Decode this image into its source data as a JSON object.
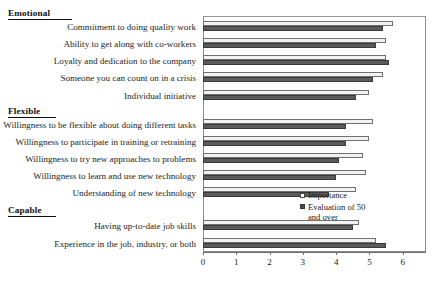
{
  "chart_data": {
    "type": "bar",
    "orientation": "horizontal",
    "title": "",
    "subtitle": "",
    "xlabel": "",
    "ylabel": "",
    "xlim": [
      0,
      6.7
    ],
    "xticks": [
      0,
      1,
      2,
      3,
      4,
      5,
      6
    ],
    "xtick_labels": [
      "0",
      "1",
      "2",
      "3",
      "4",
      "5",
      "6"
    ],
    "grid": false,
    "legend_position": "inside-right",
    "series": [
      {
        "name": "Importance",
        "color": "#f2f2f2",
        "values": [
          5.7,
          5.5,
          5.5,
          5.4,
          5.0,
          5.1,
          5.0,
          4.8,
          4.9,
          4.6,
          4.7,
          5.2
        ]
      },
      {
        "name": "Evaluation of 50 and over",
        "color": "#5b5b5b",
        "values": [
          5.4,
          5.2,
          5.6,
          5.1,
          4.6,
          4.3,
          4.3,
          4.1,
          4.0,
          3.8,
          4.5,
          5.5
        ]
      }
    ],
    "categories": [
      "Commitment to doing quality work",
      "Ability to get along with co-workers",
      "Loyalty and dedication to the company",
      "Someone you can count on in a crisis",
      "Individual initiative",
      "Willingness to be flexible about doing different tasks",
      "Willingness to participate in training or retraining",
      "Willingness to try new approaches to problems",
      "Willingness to learn and use new technology",
      "Understanding of new technology",
      "Having up-to-date job skills",
      "Experience in the job, industry, or both"
    ],
    "groups": [
      {
        "heading": "Emotional",
        "categories": [
          "Commitment to doing quality work",
          "Ability to get along with co-workers",
          "Loyalty and dedication to the company",
          "Someone you can count on in a crisis",
          "Individual initiative"
        ]
      },
      {
        "heading": "Flexible",
        "categories": [
          "Willingness to be flexible about doing different tasks",
          "Willingness to participate in training or retraining",
          "Willingness to try new approaches to problems",
          "Willingness to learn and use new technology",
          "Understanding of new technology"
        ]
      },
      {
        "heading": "Capable",
        "categories": [
          "Having up-to-date job skills",
          "Experience in the job, industry, or both"
        ]
      }
    ],
    "legend": [
      {
        "label": "Importance",
        "swatch": "importance"
      },
      {
        "label": "Evaluation of 50\nand over",
        "swatch": "evaluation"
      }
    ]
  }
}
